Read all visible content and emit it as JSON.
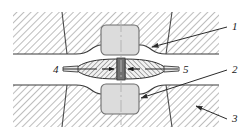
{
  "diagram": {
    "view_width": 244,
    "view_height": 139,
    "background_color": "#ffffff"
  },
  "colors": {
    "hatch_line": "#9a9a9a",
    "hatch_line_dense": "#8d8d8d",
    "outline": "#3a3a3a",
    "outline_soft": "#555555",
    "electrode_fill": "#dcdcdc",
    "electrode_stroke": "#6d6d6d",
    "sheet_fill": "#e8e8e8",
    "nugget_core": "#707070",
    "centerline": "#b4b4b4",
    "leader_line": "#2b2b2b",
    "label_text": "#1a1a1a"
  },
  "callouts": [
    {
      "id": "callout-1",
      "label": "1",
      "label_x": 232,
      "label_y": 30,
      "leader_from_x": 227,
      "leader_from_y": 27,
      "leader_to_x": 152,
      "leader_to_y": 47,
      "arrow": true,
      "meaning": "upper-workpiece-indentation"
    },
    {
      "id": "callout-2",
      "label": "2",
      "label_x": 232,
      "label_y": 73,
      "leader_from_x": 227,
      "leader_from_y": 70,
      "leader_to_x": 141,
      "leader_to_y": 98,
      "arrow": true,
      "meaning": "lower-electrode"
    },
    {
      "id": "callout-3",
      "label": "3",
      "label_x": 232,
      "label_y": 122,
      "leader_from_x": 227,
      "leader_from_y": 119,
      "leader_to_x": 196,
      "leader_to_y": 106,
      "arrow": true,
      "meaning": "lower-workpiece-body"
    },
    {
      "id": "callout-4",
      "label": "4",
      "label_x": 56,
      "label_y": 73,
      "leader_from_x": 63,
      "leader_from_y": 70,
      "leader_to_x": 95,
      "leader_to_y": 70,
      "arrow": false,
      "meaning": "heat-affected-zone-left"
    },
    {
      "id": "callout-5",
      "label": "5",
      "label_x": 182,
      "label_y": 73,
      "leader_from_x": 178,
      "leader_from_y": 70,
      "leader_to_x": 148,
      "leader_to_y": 70,
      "arrow": false,
      "meaning": "weld-nugget"
    }
  ],
  "regions": {
    "upper_block": {
      "name": "upper-workpiece",
      "left": 13,
      "right": 219,
      "top": 12,
      "divider_left_x_top": 62,
      "divider_left_x_bottom": 67,
      "divider_right_x_top": 172,
      "divider_right_x_bottom": 166
    },
    "lower_block": {
      "name": "lower-workpiece",
      "left": 13,
      "right": 219,
      "bottom": 127,
      "divider_left_x_bottom": 62,
      "divider_left_x_top": 67,
      "divider_right_x_bottom": 172,
      "divider_right_x_top": 166
    },
    "upper_electrode": {
      "name": "upper-electrode",
      "x": 101,
      "y": 25,
      "width": 38,
      "height": 30,
      "corner_radius": 5
    },
    "lower_electrode": {
      "name": "lower-electrode",
      "x": 101,
      "y": 84,
      "width": 38,
      "height": 30,
      "corner_radius": 5
    },
    "nugget": {
      "name": "weld-nugget",
      "center_x": 121,
      "center_y": 69,
      "half_width": 46,
      "half_height": 9,
      "core_width": 9,
      "core_height": 12
    },
    "centerline": {
      "x": 121,
      "y_top": 20,
      "y_bottom": 125
    }
  }
}
